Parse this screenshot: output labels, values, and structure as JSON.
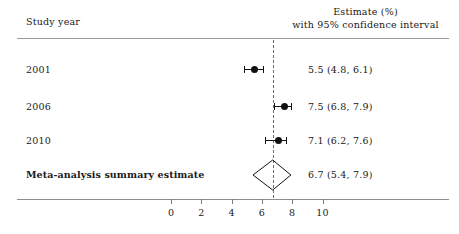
{
  "header": {
    "left": "Study year",
    "right_line1": "Estimate (%)",
    "right_line2": "with 95% confidence interval"
  },
  "axis": {
    "ticks": [
      0,
      2,
      4,
      6,
      8,
      10
    ],
    "tick_labels": [
      "0",
      "2",
      "4",
      "6",
      "8",
      "10"
    ]
  },
  "rows": [
    {
      "label": "2001",
      "value_text": "5.5 (4.8, 6.1)",
      "estimate": 5.5,
      "ci_low": 4.8,
      "ci_high": 6.1,
      "type": "study"
    },
    {
      "label": "2006",
      "value_text": "7.5 (6.8, 7.9)",
      "estimate": 7.5,
      "ci_low": 6.8,
      "ci_high": 7.9,
      "type": "study"
    },
    {
      "label": "2010",
      "value_text": "7.1 (6.2, 7.6)",
      "estimate": 7.1,
      "ci_low": 6.2,
      "ci_high": 7.6,
      "type": "study"
    },
    {
      "label": "Meta-analysis summary estimate",
      "value_text": "6.7 (5.4, 7.9)",
      "estimate": 6.7,
      "ci_low": 5.4,
      "ci_high": 7.9,
      "type": "summary"
    }
  ],
  "reference_line": 6.7,
  "colors": {
    "marker": "#111111",
    "rule": "#9a9a9a",
    "dashed": "#6f6f6f",
    "text": "#1a1a1a"
  },
  "chart_data": {
    "type": "forest",
    "title": "",
    "xlabel": "",
    "ylabel": "",
    "xlim": [
      -1.2,
      11.5
    ],
    "grid": false,
    "legend": null,
    "xticks": [
      0,
      2,
      4,
      6,
      8,
      10
    ],
    "reference_line": 6.7,
    "categories": [
      "2001",
      "2006",
      "2010",
      "Meta-analysis summary estimate"
    ],
    "values": [
      5.5,
      7.5,
      7.1,
      6.7
    ],
    "ci_low": [
      4.8,
      6.8,
      6.2,
      5.4
    ],
    "ci_high": [
      6.1,
      7.9,
      7.6,
      7.9
    ],
    "labels": [
      "5.5 (4.8, 6.1)",
      "7.5 (6.8, 7.9)",
      "7.1 (6.2, 7.6)",
      "6.7 (5.4, 7.9)"
    ],
    "marker_types": [
      "point",
      "point",
      "point",
      "diamond"
    ],
    "column_headers": [
      "Study year",
      "Estimate (%) with 95% confidence interval"
    ]
  }
}
